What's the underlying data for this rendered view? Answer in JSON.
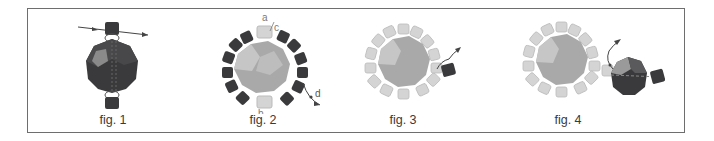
{
  "figures": [
    {
      "caption": "fig. 1",
      "description": "Dark faceted round bead with a dark cube bead above and below; thread passes through top cube with arrows"
    },
    {
      "caption": "fig. 2",
      "description": "Light faceted round bead encircled by 14 dark cube beads and 2 light cube beads at top and bottom",
      "labels": [
        "a",
        "c",
        "b",
        "d"
      ]
    },
    {
      "caption": "fig. 3",
      "description": "Light round bead encircled by light cube beads with a dark cube bead added on the right; arrow showing thread path"
    },
    {
      "caption": "fig. 4",
      "description": "Light encircled round bead joined on the right to a dark faceted round bead and a dark cube bead; arrow showing thread path"
    }
  ],
  "colors": {
    "frame": "#6e6e6e",
    "dark_bead": "#3a3a3c",
    "dark_facet": "#525254",
    "dark_highlight": "#8a8a8a",
    "light_bead": "#a9a9a9",
    "light_facet": "#c2c2c2",
    "light_cube": "#d4d4d4",
    "thread": "#444444",
    "label": "#7a7a7a"
  }
}
